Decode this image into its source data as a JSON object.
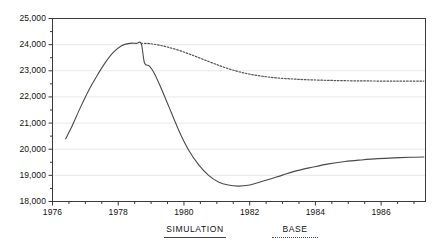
{
  "chart_data": {
    "type": "line",
    "title": "",
    "xlabel": "",
    "ylabel": "",
    "xlim": [
      1976.0,
      1987.35
    ],
    "ylim": [
      18000,
      25000
    ],
    "grid": true,
    "legend_position": "bottom",
    "ytick_labels": [
      "25,000",
      "24,000",
      "23,000",
      "22,000",
      "21,000",
      "20,000",
      "19,000",
      "18,000"
    ],
    "ytick_values": [
      25000,
      24000,
      23000,
      22000,
      21000,
      20000,
      19000,
      18000
    ],
    "yminor_step": 500,
    "xtick_labels": [
      "1976",
      "1978",
      "1980",
      "1982",
      "1984",
      "1986"
    ],
    "xtick_values": [
      1976,
      1978,
      1980,
      1982,
      1984,
      1986
    ],
    "xminor_step": 0.5,
    "series": [
      {
        "name": "SIMULATION",
        "style": "solid",
        "color": "#4a4a4a",
        "x": [
          1976.4,
          1976.6,
          1976.85,
          1977.1,
          1977.35,
          1977.6,
          1977.85,
          1978.1,
          1978.35,
          1978.55,
          1978.7,
          1978.8,
          1978.95,
          1979.1,
          1979.3,
          1979.55,
          1979.85,
          1980.15,
          1980.45,
          1980.75,
          1981.05,
          1981.35,
          1981.65,
          1981.95,
          1982.25,
          1982.6,
          1983.0,
          1983.45,
          1983.9,
          1984.4,
          1984.9,
          1985.4,
          1985.9,
          1986.4,
          1986.9,
          1987.3
        ],
        "y": [
          20400,
          20900,
          21600,
          22250,
          22800,
          23300,
          23700,
          23960,
          24050,
          24050,
          24040,
          23300,
          23180,
          22900,
          22350,
          21600,
          20700,
          19950,
          19400,
          19000,
          18750,
          18630,
          18590,
          18620,
          18720,
          18850,
          19010,
          19180,
          19310,
          19440,
          19530,
          19590,
          19640,
          19670,
          19690,
          19700
        ]
      },
      {
        "name": "BASE",
        "style": "dotted",
        "color": "#555555",
        "x": [
          1978.7,
          1978.95,
          1979.25,
          1979.55,
          1979.9,
          1980.25,
          1980.6,
          1980.95,
          1981.3,
          1981.65,
          1982.0,
          1982.4,
          1982.8,
          1983.25,
          1983.7,
          1984.2,
          1984.7,
          1985.2,
          1985.7,
          1986.2,
          1986.7,
          1987.3
        ],
        "y": [
          24050,
          24040,
          23980,
          23890,
          23760,
          23600,
          23430,
          23260,
          23100,
          22970,
          22870,
          22790,
          22730,
          22690,
          22660,
          22640,
          22625,
          22615,
          22610,
          22605,
          22605,
          22605
        ]
      }
    ]
  },
  "legend": {
    "items": [
      {
        "label": "SIMULATION",
        "style": "solid"
      },
      {
        "label": "BASE",
        "style": "dotted"
      }
    ]
  },
  "colors": {
    "axis": "#3a3a3a",
    "grid": "#e8e8e8",
    "simulation": "#4a4a4a",
    "base": "#555555",
    "text": "#111111"
  }
}
